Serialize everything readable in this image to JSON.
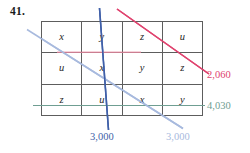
{
  "problem": {
    "number": "41."
  },
  "grid": {
    "rows": [
      {
        "cells": [
          "x",
          "y",
          "z",
          "u"
        ]
      },
      {
        "cells": [
          "u",
          "x",
          "y",
          "z"
        ]
      },
      {
        "cells": [
          "z",
          "u",
          "x",
          "y"
        ]
      }
    ],
    "columns": 4,
    "row_count": 3,
    "border_color": "#5d5d5d"
  },
  "lines": [
    {
      "name": "red-constraint-line",
      "label": "2,060",
      "color": "#e0436f",
      "style": "diagonal-descending"
    },
    {
      "name": "red-horizontal-segment",
      "color": "#e8879f",
      "style": "horizontal"
    },
    {
      "name": "dark-blue-constraint-line",
      "label": "3,000",
      "color": "#3f5fa8",
      "style": "steep-descending"
    },
    {
      "name": "light-blue-constraint-line",
      "label": "3,000",
      "color": "#a8bade",
      "style": "diagonal-descending"
    },
    {
      "name": "teal-constraint-line",
      "label": "4,030",
      "color": "#6f9e92",
      "style": "horizontal"
    }
  ],
  "labels": {
    "value_2060": "2,060",
    "value_4030": "4,030",
    "value_3000_dark": "3,000",
    "value_3000_light": "3,000"
  }
}
